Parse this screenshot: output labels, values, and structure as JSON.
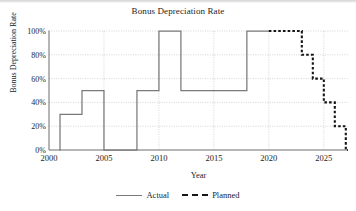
{
  "chart_data": {
    "type": "line",
    "title": "Bonus Depreciation Rate",
    "xlabel": "Year",
    "ylabel": "Bonus Depreciation Rate",
    "xlim": [
      2000,
      2027.2
    ],
    "ylim": [
      0,
      1.0
    ],
    "grid": true,
    "legend_position": "bottom",
    "xticks": [
      2000,
      2005,
      2010,
      2015,
      2020,
      2025
    ],
    "xtick_labels": [
      "2000",
      "2005",
      "2010",
      "2015",
      "2020",
      "2025"
    ],
    "yticks": [
      0,
      0.2,
      0.4,
      0.6,
      0.8,
      1.0
    ],
    "ytick_labels": [
      "0%",
      "20%",
      "40%",
      "60%",
      "80%",
      "100%"
    ],
    "series": [
      {
        "name": "Actual",
        "style": "solid",
        "color": "#7a7a7a",
        "step": "post",
        "points": [
          {
            "x": 2001,
            "y": 0.3
          },
          {
            "x": 2003,
            "y": 0.5
          },
          {
            "x": 2005,
            "y": 0.0
          },
          {
            "x": 2008,
            "y": 0.5
          },
          {
            "x": 2010,
            "y": 1.0
          },
          {
            "x": 2012,
            "y": 0.5
          },
          {
            "x": 2018,
            "y": 1.0
          },
          {
            "x": 2020,
            "y": 1.0
          }
        ]
      },
      {
        "name": "Planned",
        "style": "dashed",
        "color": "#161616",
        "step": "post",
        "points": [
          {
            "x": 2020,
            "y": 1.0
          },
          {
            "x": 2023,
            "y": 0.8
          },
          {
            "x": 2024,
            "y": 0.6
          },
          {
            "x": 2025,
            "y": 0.4
          },
          {
            "x": 2026,
            "y": 0.2
          },
          {
            "x": 2027,
            "y": 0.0
          }
        ]
      }
    ]
  },
  "legend": {
    "items": [
      {
        "label": "Actual"
      },
      {
        "label": "Planned"
      }
    ]
  }
}
